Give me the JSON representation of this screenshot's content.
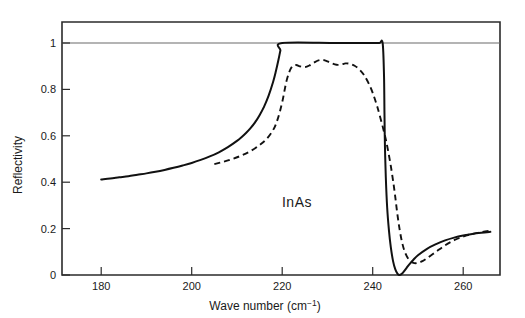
{
  "chart_data": {
    "type": "line",
    "title": "",
    "xlabel": "Wave number (cm⁻¹)",
    "ylabel": "Reflectivity",
    "annotation": "InAs",
    "xlim": [
      172,
      268
    ],
    "ylim": [
      0,
      1.04
    ],
    "xticks": [
      180,
      200,
      220,
      240,
      260
    ],
    "xtick_labels": [
      "180",
      "200",
      "220",
      "240",
      "260"
    ],
    "yticks": [
      0,
      0.2,
      0.4,
      0.6,
      0.8,
      1
    ],
    "ytick_labels": [
      "0",
      "0.2",
      "0.4",
      "0.6",
      "0.8",
      "1"
    ],
    "grid": false,
    "reference_lines": [
      {
        "axis": "y",
        "value": 1,
        "style": "solid",
        "color": "#6b6b6b"
      }
    ],
    "legend_position": "none",
    "series": [
      {
        "name": "theory-single-oscillator",
        "style": "solid",
        "color": "#111111",
        "x": [
          180,
          182,
          184,
          186,
          188,
          190,
          192,
          194,
          196,
          198,
          200,
          202,
          204,
          206,
          208,
          210,
          211,
          212,
          213,
          214,
          215,
          216,
          217,
          218,
          218.6,
          219.2,
          219.6,
          220,
          232,
          240,
          241.5,
          242.2,
          242.5,
          242.6,
          242.7,
          242.9,
          243.2,
          243.6,
          244,
          244.5,
          245,
          245.5,
          246,
          246.5,
          247,
          247.5,
          248,
          249,
          250,
          252,
          254,
          256,
          258,
          260,
          262,
          264,
          266
        ],
        "y": [
          0.412,
          0.416,
          0.421,
          0.426,
          0.432,
          0.438,
          0.445,
          0.453,
          0.462,
          0.472,
          0.483,
          0.496,
          0.511,
          0.529,
          0.551,
          0.578,
          0.594,
          0.612,
          0.633,
          0.658,
          0.689,
          0.726,
          0.773,
          0.833,
          0.878,
          0.93,
          0.968,
          1.0,
          1.0,
          1.0,
          1.0,
          1.0,
          0.86,
          0.7,
          0.56,
          0.42,
          0.29,
          0.19,
          0.12,
          0.06,
          0.024,
          0.005,
          0.0,
          0.006,
          0.018,
          0.031,
          0.044,
          0.066,
          0.085,
          0.113,
          0.133,
          0.149,
          0.161,
          0.17,
          0.177,
          0.182,
          0.186
        ],
        "x_start": 180,
        "x_end": 266
      },
      {
        "name": "experimental-measurement",
        "style": "dashed",
        "color": "#111111",
        "x": [
          205,
          207,
          209,
          211,
          213,
          215,
          216.5,
          218,
          219,
          220,
          221,
          222,
          223,
          224,
          225,
          226,
          227,
          228,
          229,
          230,
          231,
          232,
          233,
          234,
          235,
          236,
          237,
          238,
          239,
          240,
          241,
          242,
          243,
          244,
          244.8,
          245.4,
          246,
          246.6,
          247.2,
          248,
          249,
          250,
          251,
          252,
          254,
          256,
          258,
          260,
          262,
          264,
          266
        ],
        "y": [
          0.478,
          0.488,
          0.5,
          0.515,
          0.534,
          0.56,
          0.585,
          0.625,
          0.672,
          0.745,
          0.84,
          0.893,
          0.905,
          0.899,
          0.896,
          0.903,
          0.915,
          0.925,
          0.927,
          0.921,
          0.912,
          0.906,
          0.907,
          0.912,
          0.91,
          0.902,
          0.887,
          0.864,
          0.83,
          0.785,
          0.726,
          0.655,
          0.575,
          0.47,
          0.365,
          0.27,
          0.19,
          0.132,
          0.095,
          0.066,
          0.052,
          0.052,
          0.06,
          0.072,
          0.1,
          0.128,
          0.15,
          0.166,
          0.177,
          0.185,
          0.191
        ],
        "x_start": 205,
        "x_end": 266
      }
    ]
  },
  "axes": {
    "y_axis_title": "Reflectivity",
    "x_axis_title": "Wave number (cm⁻¹)"
  },
  "figure": {
    "material_label": "InAs",
    "background_color": "#ffffff",
    "frame_color": "#2b2b2b"
  }
}
